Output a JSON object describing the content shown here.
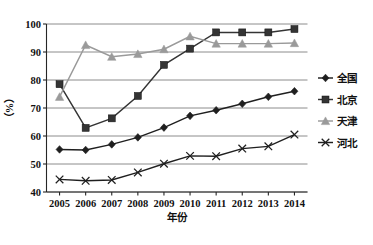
{
  "chart_data": {
    "type": "line",
    "title": "",
    "xlabel": "年份",
    "ylabel": "（%）",
    "categories": [
      "2005",
      "2006",
      "2007",
      "2008",
      "2009",
      "2010",
      "2011",
      "2012",
      "2013",
      "2014"
    ],
    "x": [
      2005,
      2006,
      2007,
      2008,
      2009,
      2010,
      2011,
      2012,
      2013,
      2014
    ],
    "ylim": [
      40,
      100
    ],
    "yticks": [
      40,
      50,
      60,
      70,
      80,
      90,
      100
    ],
    "ytick_labels": [
      "40",
      "50",
      "60",
      "70",
      "80",
      "90",
      "100"
    ],
    "grid": true,
    "legend_position": "right",
    "series": [
      {
        "name": "全国",
        "marker": "diamond",
        "color": "#1f1f1f",
        "values": [
          55.2,
          55.0,
          57.0,
          59.5,
          63.0,
          67.2,
          69.2,
          71.5,
          74.0,
          76.0
        ]
      },
      {
        "name": "北京",
        "marker": "square",
        "color": "#343434",
        "values": [
          78.5,
          62.9,
          66.3,
          74.3,
          85.4,
          91.2,
          97.0,
          97.0,
          97.0,
          98.2
        ]
      },
      {
        "name": "天津",
        "marker": "triangle",
        "color": "#9a9a9a",
        "values": [
          74.0,
          92.5,
          88.3,
          89.3,
          91.0,
          95.6,
          93.0,
          93.0,
          93.0,
          93.2
        ]
      },
      {
        "name": "河北",
        "marker": "cross",
        "color": "#1f1f1f",
        "values": [
          44.5,
          44.0,
          44.3,
          47.0,
          50.1,
          52.9,
          52.8,
          55.5,
          56.3,
          60.5
        ]
      }
    ]
  },
  "legend": {
    "items": [
      {
        "label": "全国",
        "marker": "diamond",
        "color": "#1f1f1f"
      },
      {
        "label": "北京",
        "marker": "square",
        "color": "#343434"
      },
      {
        "label": "天津",
        "marker": "triangle",
        "color": "#9a9a9a"
      },
      {
        "label": "河北",
        "marker": "cross",
        "color": "#1f1f1f"
      }
    ]
  },
  "axes": {
    "y_axis_label": "（%）",
    "x_axis_label": "年份"
  }
}
